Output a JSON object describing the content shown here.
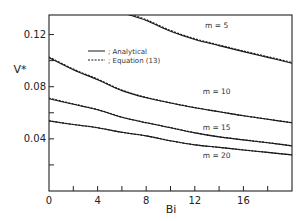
{
  "chart_data": {
    "type": "line",
    "title": "",
    "xlabel": "Bi",
    "ylabel": "V*",
    "xlim": [
      0,
      20
    ],
    "ylim": [
      0,
      0.135
    ],
    "grid": false,
    "legend_position": "upper-left-inside",
    "legend": [
      {
        "label": "; Analytical",
        "style": "solid"
      },
      {
        "label": "; Equation (13)",
        "style": "dashed"
      }
    ],
    "x_ticks": [
      0,
      4,
      8,
      12,
      16
    ],
    "x_tick_labels": [
      "0",
      "4",
      "8",
      "12",
      "16"
    ],
    "x_minor_ticks": [
      2,
      6,
      10,
      14,
      18
    ],
    "y_ticks": [
      0.04,
      0.08,
      0.12
    ],
    "y_tick_labels": [
      "0.04",
      "0.08",
      "0.12"
    ],
    "y_minor_ticks": [
      0.02,
      0.06,
      0.1
    ],
    "series": [
      {
        "name": "m = 5",
        "label_pos": [
          13.8,
          0.125
        ],
        "x": [
          6.5,
          8,
          10,
          12,
          14,
          16,
          18,
          20
        ],
        "analytical": [
          0.1354,
          0.1308,
          0.1225,
          0.1162,
          0.1115,
          0.1069,
          0.1025,
          0.098
        ],
        "equation13": [
          0.136,
          0.1314,
          0.1231,
          0.1168,
          0.112,
          0.1074,
          0.103,
          0.0986
        ]
      },
      {
        "name": "m = 10",
        "label_pos": [
          13.8,
          0.0745
        ],
        "x": [
          0,
          2,
          4,
          6,
          8,
          10,
          12,
          14,
          16,
          18,
          20
        ],
        "analytical": [
          0.1023,
          0.093,
          0.0854,
          0.077,
          0.0715,
          0.0675,
          0.0638,
          0.0608,
          0.0577,
          0.055,
          0.0523
        ],
        "equation13": [
          0.1028,
          0.0935,
          0.0858,
          0.0774,
          0.0718,
          0.0677,
          0.064,
          0.0609,
          0.0578,
          0.0551,
          0.0524
        ]
      },
      {
        "name": "m = 15",
        "label_pos": [
          13.8,
          0.0465
        ],
        "x": [
          0,
          2,
          4,
          6,
          8,
          10,
          12,
          14,
          16,
          18,
          20
        ],
        "analytical": [
          0.0708,
          0.0665,
          0.0623,
          0.0565,
          0.0523,
          0.0485,
          0.0446,
          0.0415,
          0.0392,
          0.037,
          0.0346
        ],
        "equation13": [
          0.0712,
          0.0668,
          0.0625,
          0.0567,
          0.0525,
          0.0486,
          0.0447,
          0.0416,
          0.0393,
          0.0371,
          0.0347
        ]
      },
      {
        "name": "m = 20",
        "label_pos": [
          13.8,
          0.025
        ],
        "x": [
          0,
          2,
          4,
          6,
          8,
          10,
          12,
          14,
          16,
          18,
          20
        ],
        "analytical": [
          0.0538,
          0.051,
          0.0485,
          0.045,
          0.0423,
          0.0385,
          0.0354,
          0.0335,
          0.0315,
          0.0296,
          0.0277
        ],
        "equation13": [
          0.0538,
          0.051,
          0.0485,
          0.045,
          0.0423,
          0.0385,
          0.0354,
          0.0335,
          0.0315,
          0.0296,
          0.0277
        ]
      }
    ]
  },
  "colors": {
    "line": "#1a1a1a",
    "axis": "#222222",
    "background": "#ffffff"
  }
}
